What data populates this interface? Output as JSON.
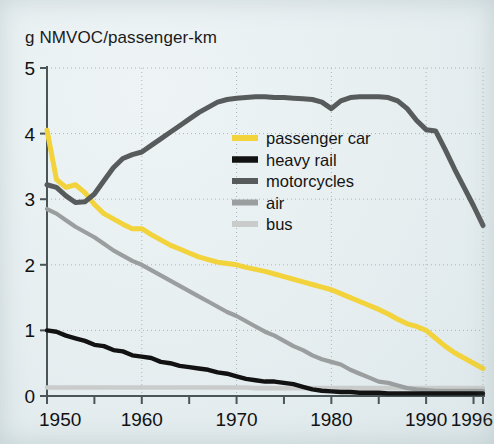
{
  "figure": {
    "ylabel": "g NMVOC/passenger-km",
    "background_color": "#e9f0f1"
  },
  "axes": {
    "y_ticks": [
      "0",
      "1",
      "2",
      "3",
      "4",
      "5"
    ],
    "x_ticks": [
      "1950",
      "1960",
      "1970",
      "1980",
      "1990",
      "1996"
    ]
  },
  "legend": {
    "items": [
      {
        "label": "passenger car",
        "color": "#f2d33c"
      },
      {
        "label": "heavy rail",
        "color": "#121212"
      },
      {
        "label": "motorcycles",
        "color": "#585b5c"
      },
      {
        "label": "air",
        "color": "#9b9e9e"
      },
      {
        "label": "bus",
        "color": "#c9cccb"
      }
    ]
  },
  "chart_data": {
    "type": "line",
    "title": "",
    "xlabel": "",
    "ylabel": "g NMVOC/passenger-km",
    "xlim": [
      1950,
      1996
    ],
    "ylim": [
      0,
      5
    ],
    "grid": true,
    "grid_style": "dotted",
    "legend_position": "upper-right-inside",
    "x_tick_labels": [
      "1950",
      "1960",
      "1970",
      "1980",
      "1990",
      "1996"
    ],
    "x_minor_tick_interval": 5,
    "y_tick_labels": [
      "0",
      "1",
      "2",
      "3",
      "4",
      "5"
    ],
    "x": [
      1950,
      1951,
      1952,
      1953,
      1954,
      1955,
      1956,
      1957,
      1958,
      1959,
      1960,
      1961,
      1962,
      1963,
      1964,
      1965,
      1966,
      1967,
      1968,
      1969,
      1970,
      1971,
      1972,
      1973,
      1974,
      1975,
      1976,
      1977,
      1978,
      1979,
      1980,
      1981,
      1982,
      1983,
      1984,
      1985,
      1986,
      1987,
      1988,
      1989,
      1990,
      1991,
      1992,
      1993,
      1994,
      1995,
      1996
    ],
    "series": [
      {
        "name": "passenger car",
        "color": "#f2d33c",
        "values": [
          4.05,
          3.3,
          3.18,
          3.22,
          3.1,
          2.92,
          2.78,
          2.7,
          2.62,
          2.55,
          2.55,
          2.46,
          2.38,
          2.3,
          2.24,
          2.18,
          2.12,
          2.08,
          2.04,
          2.02,
          2.0,
          1.96,
          1.93,
          1.9,
          1.86,
          1.82,
          1.78,
          1.74,
          1.7,
          1.66,
          1.62,
          1.56,
          1.5,
          1.44,
          1.38,
          1.32,
          1.25,
          1.17,
          1.1,
          1.06,
          1.0,
          0.88,
          0.76,
          0.66,
          0.58,
          0.5,
          0.42
        ]
      },
      {
        "name": "heavy rail",
        "color": "#121212",
        "values": [
          1.0,
          0.98,
          0.92,
          0.88,
          0.84,
          0.78,
          0.76,
          0.7,
          0.68,
          0.62,
          0.6,
          0.58,
          0.52,
          0.5,
          0.46,
          0.44,
          0.42,
          0.4,
          0.36,
          0.34,
          0.3,
          0.26,
          0.24,
          0.22,
          0.22,
          0.2,
          0.18,
          0.14,
          0.1,
          0.08,
          0.07,
          0.06,
          0.06,
          0.05,
          0.05,
          0.05,
          0.04,
          0.04,
          0.04,
          0.04,
          0.04,
          0.04,
          0.04,
          0.04,
          0.04,
          0.04,
          0.04
        ]
      },
      {
        "name": "motorcycles",
        "color": "#585b5c",
        "values": [
          3.22,
          3.18,
          3.05,
          2.95,
          2.96,
          3.08,
          3.28,
          3.48,
          3.62,
          3.68,
          3.72,
          3.82,
          3.92,
          4.02,
          4.12,
          4.22,
          4.32,
          4.4,
          4.48,
          4.52,
          4.54,
          4.55,
          4.56,
          4.56,
          4.55,
          4.55,
          4.54,
          4.53,
          4.52,
          4.48,
          4.38,
          4.5,
          4.55,
          4.56,
          4.56,
          4.56,
          4.55,
          4.5,
          4.38,
          4.2,
          4.06,
          4.04,
          3.76,
          3.46,
          3.18,
          2.9,
          2.6
        ]
      },
      {
        "name": "air",
        "color": "#9b9e9e",
        "values": [
          2.85,
          2.78,
          2.68,
          2.58,
          2.5,
          2.42,
          2.32,
          2.22,
          2.14,
          2.06,
          2.0,
          1.92,
          1.84,
          1.76,
          1.68,
          1.6,
          1.52,
          1.44,
          1.36,
          1.28,
          1.22,
          1.14,
          1.06,
          0.98,
          0.92,
          0.84,
          0.76,
          0.7,
          0.62,
          0.56,
          0.52,
          0.48,
          0.4,
          0.34,
          0.28,
          0.22,
          0.2,
          0.16,
          0.12,
          0.1,
          0.09,
          0.08,
          0.08,
          0.08,
          0.08,
          0.08,
          0.08
        ]
      },
      {
        "name": "bus",
        "color": "#c9cccb",
        "values": [
          0.13,
          0.13,
          0.13,
          0.13,
          0.13,
          0.13,
          0.13,
          0.13,
          0.13,
          0.13,
          0.13,
          0.13,
          0.13,
          0.13,
          0.13,
          0.13,
          0.13,
          0.13,
          0.13,
          0.13,
          0.13,
          0.13,
          0.12,
          0.12,
          0.12,
          0.12,
          0.12,
          0.12,
          0.12,
          0.12,
          0.12,
          0.12,
          0.12,
          0.12,
          0.12,
          0.12,
          0.12,
          0.12,
          0.12,
          0.12,
          0.12,
          0.12,
          0.12,
          0.12,
          0.12,
          0.12,
          0.12
        ]
      }
    ]
  }
}
